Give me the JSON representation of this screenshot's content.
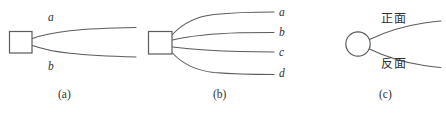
{
  "figure": {
    "width": 446,
    "height": 113,
    "background": "#ffffff",
    "stroke_color": "#5b5b60",
    "text_color": "#2f2f33",
    "panels": [
      {
        "id": "a",
        "caption": "(a)",
        "node_shape": "square",
        "branch_count": 2,
        "branch_labels": [
          "a",
          "b"
        ]
      },
      {
        "id": "b",
        "caption": "(b)",
        "node_shape": "square",
        "branch_count": 4,
        "branch_labels": [
          "a",
          "b",
          "c",
          "d"
        ]
      },
      {
        "id": "c",
        "caption": "(c)",
        "node_shape": "circle",
        "branch_count": 2,
        "branch_labels": [
          "正面",
          "反面"
        ]
      }
    ]
  },
  "panel_a": {
    "label_a": "a",
    "label_b": "b",
    "caption": "(a)"
  },
  "panel_b": {
    "label_a": "a",
    "label_b": "b",
    "label_c": "c",
    "label_d": "d",
    "caption": "(b)"
  },
  "panel_c": {
    "label_front": "正面",
    "label_back": "反面",
    "caption": "(c)"
  }
}
